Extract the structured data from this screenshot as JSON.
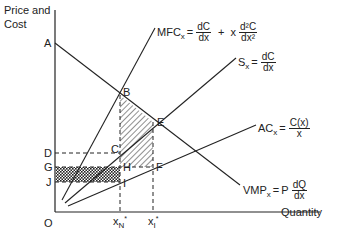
{
  "axes": {
    "y_label_line1": "Price and",
    "y_label_line2": "Cost",
    "x_label": "Quantity",
    "origin": "O"
  },
  "points": {
    "A": "A",
    "B": "B",
    "C": "C",
    "D": "D",
    "E": "E",
    "F": "F",
    "G": "G",
    "H": "H",
    "I": "I",
    "J": "J"
  },
  "ticks": {
    "xN_base": "x",
    "xN_sub": "N",
    "xN_star": "*",
    "xI_base": "x",
    "xI_sub": "I",
    "xI_star": "*"
  },
  "curves": {
    "mfc": {
      "name": "MFC",
      "sub": "x",
      "eq": "=",
      "t1_num": "dC",
      "t1_den": "dx",
      "plus": "+",
      "t2_pre": "x",
      "t2_num": "d²C",
      "t2_den": "dx²"
    },
    "s": {
      "name": "S",
      "sub": "x",
      "eq": "=",
      "num": "dC",
      "den": "dx"
    },
    "ac": {
      "name": "AC",
      "sub": "x",
      "eq": "=",
      "num": "C(x)",
      "den": "x"
    },
    "vmp": {
      "name": "VMP",
      "sub": "x",
      "eq": "=",
      "pre": "P",
      "num": "dQ",
      "den": "dx"
    }
  },
  "colors": {
    "line": "#222222",
    "background": "#ffffff"
  }
}
